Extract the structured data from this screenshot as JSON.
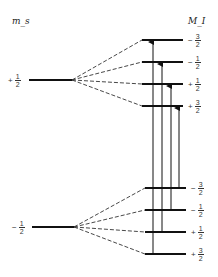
{
  "diagram": {
    "left_axis_label": "m_s",
    "right_axis_label": "M_I",
    "electron_levels": [
      {
        "id": "upper",
        "sign": "+",
        "num": "1",
        "den": "2",
        "y": 80
      },
      {
        "id": "lower",
        "sign": "−",
        "num": "1",
        "den": "2",
        "y": 227
      }
    ],
    "nuclear_levels_upper": [
      {
        "sign": "−",
        "num": "3",
        "den": "2",
        "y": 40
      },
      {
        "sign": "−",
        "num": "1",
        "den": "2",
        "y": 62
      },
      {
        "sign": "+",
        "num": "1",
        "den": "2",
        "y": 84
      },
      {
        "sign": "+",
        "num": "3",
        "den": "2",
        "y": 106
      }
    ],
    "nuclear_levels_lower": [
      {
        "sign": "−",
        "num": "3",
        "den": "2",
        "y": 188
      },
      {
        "sign": "−",
        "num": "1",
        "den": "2",
        "y": 210
      },
      {
        "sign": "+",
        "num": "1",
        "den": "2",
        "y": 232
      },
      {
        "sign": "+",
        "num": "3",
        "den": "2",
        "y": 254
      }
    ],
    "transitions": [
      {
        "from": "+3/2 (lower)",
        "to": "−3/2 (upper)",
        "x": 152
      },
      {
        "from": "+1/2 (lower)",
        "to": "−1/2 (upper)",
        "x": 161
      },
      {
        "from": "−1/2 (lower)",
        "to": "+1/2 (upper)",
        "x": 170
      },
      {
        "from": "−3/2 (lower)",
        "to": "+3/2 (upper)",
        "x": 178
      }
    ]
  }
}
